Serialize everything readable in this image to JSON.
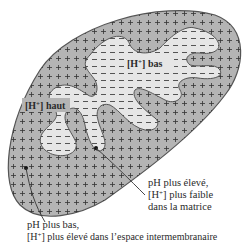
{
  "figure": {
    "type": "mitochondrion cross-section diagram",
    "colors": {
      "intermembrane_space": "#b4b4b4",
      "matrix": "#e6e6e6",
      "outline": "#555555",
      "background": "#ffffff",
      "text": "#2a2a2a"
    },
    "symbols": {
      "intermembrane_space": "+",
      "matrix": "−"
    }
  },
  "labels": {
    "matrix_region": {
      "prefix": "[H",
      "sup": "+",
      "suffix": "] bas"
    },
    "intermembrane_region": {
      "prefix": "[H",
      "sup": "+",
      "suffix": "] haut"
    },
    "callout_matrix": {
      "line1": "pH plus élevé,",
      "line2_prefix": "[H",
      "line2_sup": "+",
      "line2_suffix": "] plus faible",
      "line3": "dans la matrice"
    },
    "callout_intermembrane": {
      "line1": "pH plus bas,",
      "line2_prefix": "[H",
      "line2_sup": "+",
      "line2_suffix": "] plus élevé dans l’espace intermembranaire"
    }
  }
}
